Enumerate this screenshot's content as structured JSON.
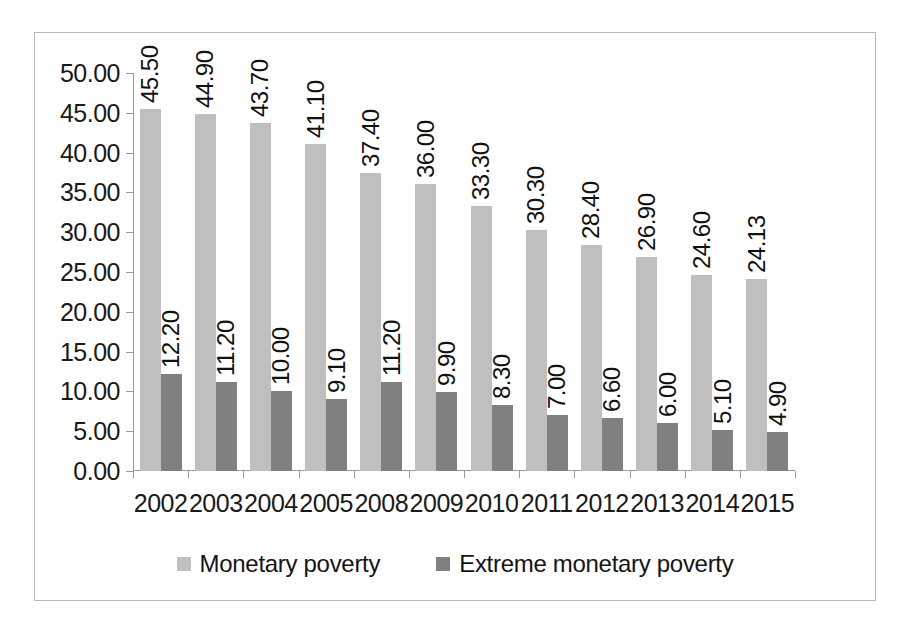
{
  "chart_data": {
    "type": "bar",
    "title": "",
    "xlabel": "",
    "ylabel": "",
    "ylim": [
      0,
      50
    ],
    "ytick_step": 5,
    "ytick_labels": [
      "0.00",
      "5.00",
      "10.00",
      "15.00",
      "20.00",
      "25.00",
      "30.00",
      "35.00",
      "40.00",
      "45.00",
      "50.00"
    ],
    "grid": false,
    "legend_position": "bottom",
    "label_orientation": "vertical",
    "categories": [
      "2002",
      "2003",
      "2004",
      "2005",
      "2008",
      "2009",
      "2010",
      "2011",
      "2012",
      "2013",
      "2014",
      "2015"
    ],
    "series": [
      {
        "name": "Monetary poverty",
        "color": "#bfbfbf",
        "values": [
          45.5,
          44.9,
          43.7,
          41.1,
          37.4,
          36.0,
          33.3,
          30.3,
          28.4,
          26.9,
          24.6,
          24.13
        ],
        "labels": [
          "45.50",
          "44.90",
          "43.70",
          "41.10",
          "37.40",
          "36.00",
          "33.30",
          "30.30",
          "28.40",
          "26.90",
          "24.60",
          "24.13"
        ]
      },
      {
        "name": "Extreme monetary poverty",
        "color": "#808080",
        "values": [
          12.2,
          11.2,
          10.0,
          9.1,
          11.2,
          9.9,
          8.3,
          7.0,
          6.6,
          6.0,
          5.1,
          4.9
        ],
        "labels": [
          "12.20",
          "11.20",
          "10.00",
          "9.10",
          "11.20",
          "9.90",
          "8.30",
          "7.00",
          "6.60",
          "6.00",
          "5.10",
          "4.90"
        ]
      }
    ]
  },
  "legend": {
    "entries": [
      {
        "label": "Monetary poverty",
        "color": "#bfbfbf"
      },
      {
        "label": "Extreme monetary poverty",
        "color": "#808080"
      }
    ]
  },
  "colors": {
    "series_light": "#bfbfbf",
    "series_dark": "#808080",
    "axis": "#9a9a9a",
    "frame": "#b9b9b9",
    "text": "#1a1a1a"
  }
}
